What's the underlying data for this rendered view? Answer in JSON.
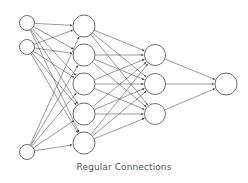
{
  "caption": "Regular Connections",
  "colors": {
    "stroke": "#6e6e6e",
    "node_fill": "#ffffff",
    "edge": "#555555",
    "text": "#555555"
  },
  "layers": [
    {
      "name": "input",
      "x": 27,
      "r": 7.5,
      "ys": [
        23,
        47,
        152
      ]
    },
    {
      "name": "hidden1",
      "x": 84,
      "r": 11,
      "ys": [
        26,
        55,
        84,
        114,
        143
      ]
    },
    {
      "name": "hidden2",
      "x": 155,
      "r": 10.5,
      "ys": [
        55,
        84,
        114
      ]
    },
    {
      "name": "output",
      "x": 226,
      "r": 11,
      "ys": [
        84
      ]
    }
  ],
  "connections": "fully-connected between adjacent layers"
}
